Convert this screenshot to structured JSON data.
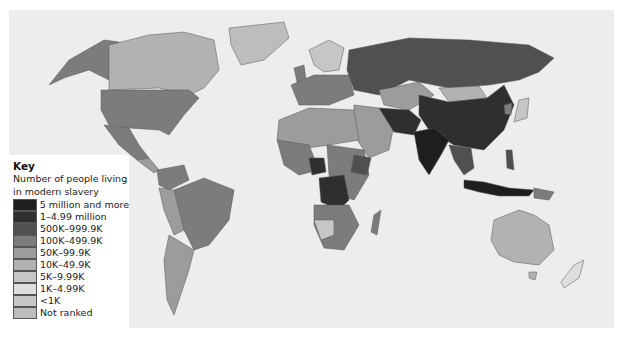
{
  "key": {
    "title": "Key",
    "subtitle_line1": "Number of people living",
    "subtitle_line2": "in modern slavery",
    "items": [
      {
        "label": "5 million and more",
        "color": "#1e1e1e"
      },
      {
        "label": "1–4.99 million",
        "color": "#2f2f2f"
      },
      {
        "label": "500K–999.9K",
        "color": "#505050"
      },
      {
        "label": "100K–499.9K",
        "color": "#7c7c7c"
      },
      {
        "label": "50K–99.9K",
        "color": "#9c9c9c"
      },
      {
        "label": "10K–49.9K",
        "color": "#b2b2b2"
      },
      {
        "label": "5K–9.99K",
        "color": "#c6c6c6"
      },
      {
        "label": "1K–4.99K",
        "color": "#dedede"
      },
      {
        "label": "<1K",
        "color": "#c8c8c8"
      },
      {
        "label": "Not ranked",
        "color": "#bdbdbd"
      }
    ]
  },
  "map": {
    "background": "#ededed",
    "regions": [
      {
        "name": "alaska",
        "class": "100K–499.9K"
      },
      {
        "name": "canada",
        "class": "10K–49.9K"
      },
      {
        "name": "greenland",
        "class": "Not ranked"
      },
      {
        "name": "usa",
        "class": "100K–499.9K"
      },
      {
        "name": "mexico",
        "class": "100K–499.9K"
      },
      {
        "name": "brazil",
        "class": "100K–499.9K"
      },
      {
        "name": "russia",
        "class": "500K–999.9K"
      },
      {
        "name": "china",
        "class": "1–4.99 million"
      },
      {
        "name": "india",
        "class": "5 million and more"
      },
      {
        "name": "pakistan",
        "class": "1–4.99 million"
      },
      {
        "name": "nigeria",
        "class": "500K–999.9K"
      },
      {
        "name": "dr-congo",
        "class": "500K–999.9K"
      },
      {
        "name": "australia",
        "class": "10K–49.9K"
      },
      {
        "name": "indonesia",
        "class": "500K–999.9K"
      }
    ]
  }
}
